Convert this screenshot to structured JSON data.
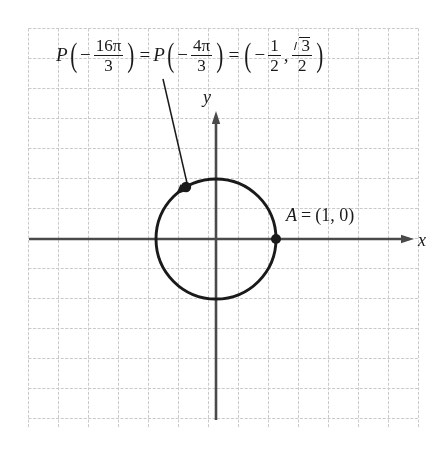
{
  "figure": {
    "title_equation": "P(-16π/3) = P(-4π/3) = (-1/2, √3/2)",
    "background_color": "#ffffff",
    "grid_color": "#c9c9c9",
    "ink_color": "#1a1a1a"
  },
  "equation": {
    "p1_func": "P",
    "p1_open": "(",
    "p1_sign": "−",
    "p1_numerator": "16π",
    "p1_denominator": "3",
    "p1_close": ")",
    "equals_1": "=",
    "p2_func": "P",
    "p2_open": "(",
    "p2_sign": "−",
    "p2_numerator": "4π",
    "p2_denominator": "3",
    "p2_close": ")",
    "equals_2": "=",
    "coord_open": "(",
    "coord_x_sign": "−",
    "coord_x_numerator": "1",
    "coord_x_denominator": "2",
    "comma": ",",
    "coord_y_radicand": "3",
    "coord_y_denominator": "2",
    "coord_close": ")"
  },
  "axes": {
    "x_label": "x",
    "y_label": "y"
  },
  "point_a": {
    "label_name": "A",
    "label_equals": "=",
    "label_coords": "(1, 0)"
  },
  "chart_data": {
    "type": "scatter",
    "xlabel": "x",
    "ylabel": "y",
    "grid": true,
    "legend": "none",
    "unit_circle": {
      "center_x": 0,
      "center_y": 0,
      "radius": 1
    },
    "points": [
      {
        "name": "A",
        "x": 1,
        "y": 0,
        "label": "A = (1, 0)"
      },
      {
        "name": "P",
        "x": -0.5,
        "y": 0.8660254,
        "label": "P(-16π/3) = P(-4π/3) = (-1/2, √3/2)"
      }
    ],
    "arc_direction": "counterclockwise",
    "angle_radians": -16.755,
    "angle_expression": "-16π/3"
  }
}
